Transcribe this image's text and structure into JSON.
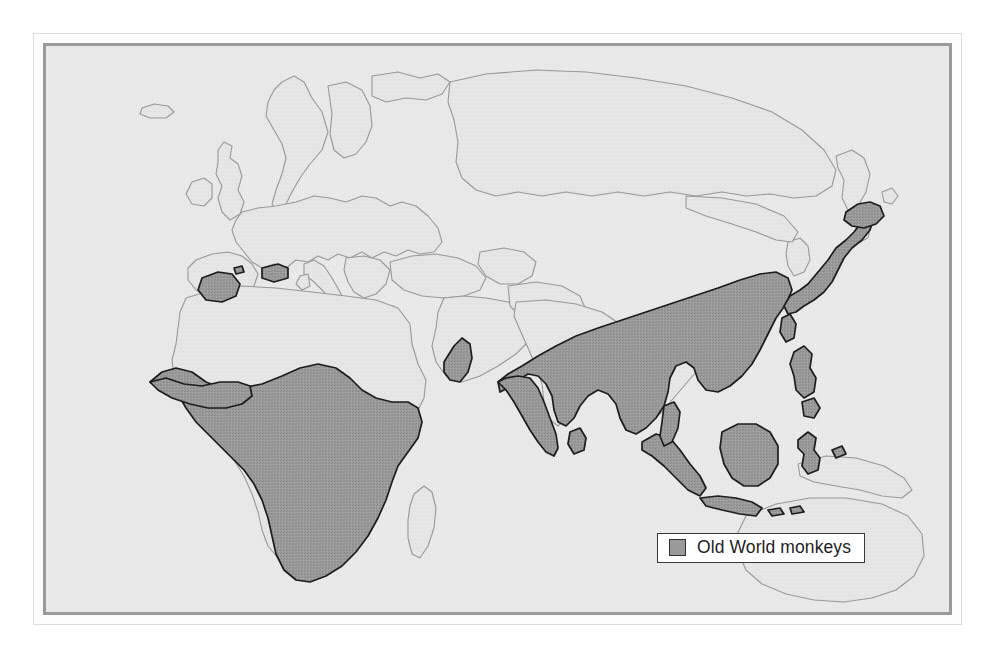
{
  "figure": {
    "kind": "distribution-map",
    "subject": "Old World monkeys"
  },
  "legend": {
    "label": "Old World monkeys",
    "swatch_name": "range-shading-swatch",
    "swatch_color": "#9a9a9a",
    "swatch_border_color": "#2e2e2e",
    "box_background": "#ffffff",
    "box_border_color": "#3a3a3a"
  },
  "map": {
    "projection_extent": "Africa, Europe, Asia, Australasia",
    "background_color": "#ededed",
    "land_outline_color": "#9b9b9b",
    "range_fill_color": "#9a9a9a",
    "range_outline_color": "#1e1e1e",
    "frame_color": "#9a9a9a",
    "outer_frame_color": "#dcdcdc",
    "shaded_regions": [
      "Sub-Saharan Africa",
      "Morocco / Atlas",
      "northern Algeria patch",
      "Gibraltar",
      "southwest Arabia (Yemen)",
      "Indian subcontinent margins",
      "Sri Lanka",
      "southern China",
      "Indochina",
      "Taiwan",
      "Japan",
      "Philippines",
      "Sumatra",
      "Java",
      "Borneo",
      "Sulawesi",
      "Lesser Sunda Islands"
    ],
    "unshaded_regions": [
      "Europe",
      "North Africa / Sahara",
      "Arabian interior",
      "Central Asia",
      "Korea",
      "New Guinea",
      "Australia",
      "Madagascar",
      "Deccan interior"
    ]
  }
}
